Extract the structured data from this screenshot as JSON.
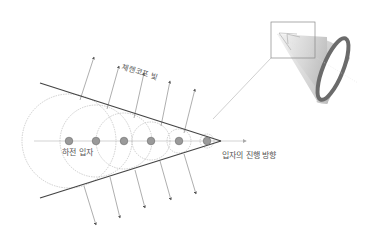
{
  "labels": {
    "cherenkov_light": "체렌코프 빛",
    "charged_particle": "하전 입자",
    "particle_direction": "입자의 진행 방향"
  },
  "colors": {
    "background": "#ffffff",
    "line": "#555555",
    "cone_edge": "#444444",
    "circle": "#b0b0b0",
    "particle_fill": "#9a9a9a",
    "particle_stroke": "#6a6a6a",
    "axis": "#c8c8c8",
    "ring": "#6b6b6b"
  },
  "diagram": {
    "axis_y": 141,
    "apex": [
      221,
      141
    ],
    "particles": [
      {
        "x": 69,
        "r": 47
      },
      {
        "x": 96,
        "r": 36
      },
      {
        "x": 124,
        "r": 28
      },
      {
        "x": 151,
        "r": 19
      },
      {
        "x": 179,
        "r": 12
      },
      {
        "x": 207,
        "r": 7
      }
    ],
    "light_rays_up": 5,
    "light_rays_down": 5
  }
}
